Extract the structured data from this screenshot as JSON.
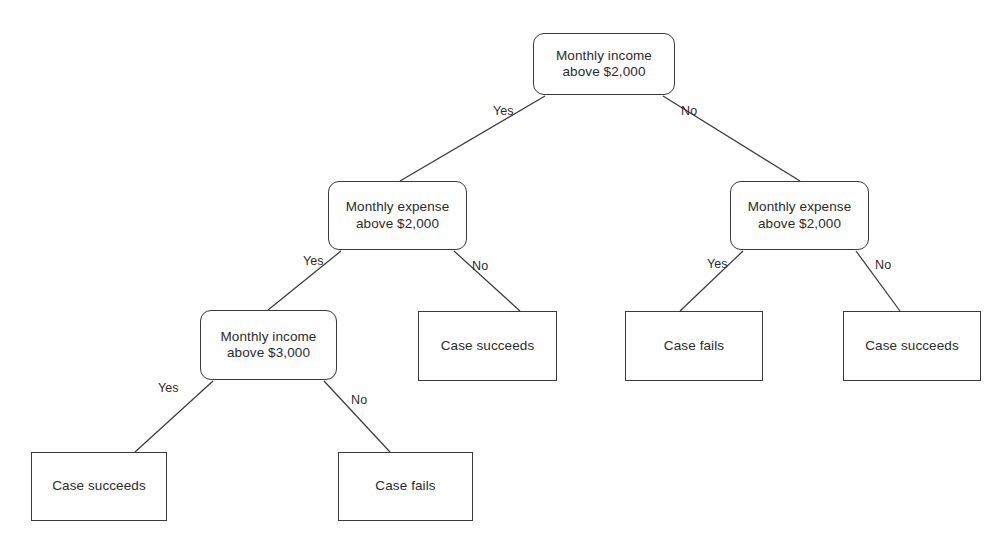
{
  "diagram": {
    "type": "decision-tree",
    "title": "",
    "palette": {
      "background": "#ffffff",
      "stroke": "#3a3a3a",
      "text": "#2b2b2b"
    },
    "nodes": [
      {
        "id": "root",
        "kind": "decision",
        "label": "Monthly income\nabove $2,000",
        "x": 533,
        "y": 33,
        "w": 142,
        "h": 62
      },
      {
        "id": "left-expense",
        "kind": "decision",
        "label": "Monthly expense\nabove $2,000",
        "x": 328,
        "y": 181,
        "w": 139,
        "h": 69
      },
      {
        "id": "right-expense",
        "kind": "decision",
        "label": "Monthly expense\nabove $2,000",
        "x": 730,
        "y": 181,
        "w": 139,
        "h": 69
      },
      {
        "id": "income-3000",
        "kind": "decision",
        "label": "Monthly income\nabove $3,000",
        "x": 200,
        "y": 310,
        "w": 137,
        "h": 70
      },
      {
        "id": "leaf-succeeds-mid",
        "kind": "leaf",
        "label": "Case succeeds",
        "x": 418,
        "y": 311,
        "w": 139,
        "h": 70
      },
      {
        "id": "leaf-fails-right",
        "kind": "leaf",
        "label": "Case fails",
        "x": 625,
        "y": 311,
        "w": 138,
        "h": 70
      },
      {
        "id": "leaf-succeeds-right",
        "kind": "leaf",
        "label": "Case succeeds",
        "x": 843,
        "y": 311,
        "w": 138,
        "h": 70
      },
      {
        "id": "leaf-succeeds-bottom",
        "kind": "leaf",
        "label": "Case succeeds",
        "x": 31,
        "y": 452,
        "w": 136,
        "h": 69
      },
      {
        "id": "leaf-fails-bottom",
        "kind": "leaf",
        "label": "Case fails",
        "x": 338,
        "y": 452,
        "w": 135,
        "h": 69
      }
    ],
    "edges": [
      {
        "id": "root-yes",
        "from": "root",
        "to": "left-expense",
        "label": "Yes",
        "x1": 545,
        "y1": 96,
        "x2": 400,
        "y2": 181,
        "label_x": 493,
        "label_y": 104
      },
      {
        "id": "root-no",
        "from": "root",
        "to": "right-expense",
        "label": "No",
        "x1": 663,
        "y1": 96,
        "x2": 800,
        "y2": 181,
        "label_x": 681,
        "label_y": 104
      },
      {
        "id": "left-expense-yes",
        "from": "left-expense",
        "to": "income-3000",
        "label": "Yes",
        "x1": 341,
        "y1": 251,
        "x2": 268,
        "y2": 310,
        "label_x": 303,
        "label_y": 254
      },
      {
        "id": "left-expense-no",
        "from": "left-expense",
        "to": "leaf-succeeds-mid",
        "label": "No",
        "x1": 454,
        "y1": 251,
        "x2": 520,
        "y2": 311,
        "label_x": 472,
        "label_y": 259
      },
      {
        "id": "right-expense-yes",
        "from": "right-expense",
        "to": "leaf-fails-right",
        "label": "Yes",
        "x1": 743,
        "y1": 251,
        "x2": 680,
        "y2": 311,
        "label_x": 707,
        "label_y": 257
      },
      {
        "id": "right-expense-no",
        "from": "right-expense",
        "to": "leaf-succeeds-right",
        "label": "No",
        "x1": 856,
        "y1": 251,
        "x2": 900,
        "y2": 311,
        "label_x": 875,
        "label_y": 258
      },
      {
        "id": "income-3000-yes",
        "from": "income-3000",
        "to": "leaf-succeeds-bottom",
        "label": "Yes",
        "x1": 213,
        "y1": 381,
        "x2": 135,
        "y2": 452,
        "label_x": 158,
        "label_y": 381
      },
      {
        "id": "income-3000-no",
        "from": "income-3000",
        "to": "leaf-fails-bottom",
        "label": "No",
        "x1": 324,
        "y1": 381,
        "x2": 390,
        "y2": 452,
        "label_x": 351,
        "label_y": 393
      }
    ]
  }
}
